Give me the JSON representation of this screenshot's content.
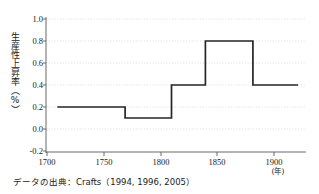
{
  "chart_data": {
    "type": "line",
    "subtype": "step-post",
    "title": "",
    "xlabel": "(年)",
    "ylabel": "生産性上昇率（%）",
    "xlim": [
      1690,
      1920
    ],
    "ylim": [
      -0.2,
      1.0
    ],
    "xticks": [
      1700,
      1750,
      1800,
      1850,
      1900
    ],
    "xtick_labels": [
      "1700",
      "1750",
      "1800",
      "1850",
      "1900"
    ],
    "yticks": [
      -0.2,
      0.0,
      0.2,
      0.4,
      0.6,
      0.8,
      1.0
    ],
    "ytick_labels": [
      "-0.2",
      "0.0",
      "0.2",
      "0.4",
      "0.6",
      "0.8",
      "1.0"
    ],
    "grid": true,
    "grid_axis": "y",
    "legend": "none",
    "series": [
      {
        "name": "生産性上皇率",
        "color": "#262626",
        "steps": [
          {
            "x_start": 1700,
            "x_end": 1760,
            "value": 0.2
          },
          {
            "x_start": 1760,
            "x_end": 1801,
            "value": 0.1
          },
          {
            "x_start": 1801,
            "x_end": 1831,
            "value": 0.4
          },
          {
            "x_start": 1831,
            "x_end": 1873,
            "value": 0.8
          },
          {
            "x_start": 1873,
            "x_end": 1913,
            "value": 0.4
          }
        ],
        "x": [
          1700,
          1760,
          1760,
          1801,
          1801,
          1831,
          1831,
          1873,
          1873,
          1913
        ],
        "values": [
          0.2,
          0.2,
          0.1,
          0.1,
          0.4,
          0.4,
          0.8,
          0.8,
          0.4,
          0.4
        ]
      }
    ],
    "annotations": []
  },
  "caption": {
    "source_text": "データの出典：Crafts（1994, 1996, 2005）"
  },
  "colors": {
    "line": "#262626",
    "grid": "#cfcfcf",
    "axis": "#555555",
    "background": "#ffffff",
    "text": "#1a1a1a"
  }
}
